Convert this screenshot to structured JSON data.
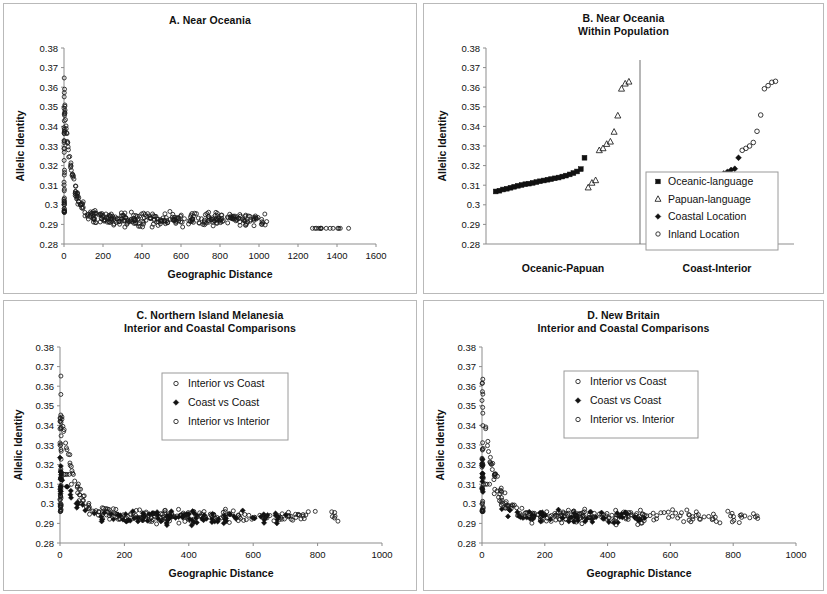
{
  "figure": {
    "panel_count": 4,
    "shared_y_label": "Allelic Identity",
    "shared_x_label": "Geographic Distance"
  },
  "chart_data": [
    {
      "id": "A",
      "type": "scatter",
      "title": "A. Near Oceania",
      "subtitle": "",
      "xlabel": "Geographic Distance",
      "ylabel": "Allelic Identity",
      "xlim": [
        0,
        1600
      ],
      "ylim": [
        0.28,
        0.38
      ],
      "xticks": [
        0,
        200,
        400,
        600,
        800,
        1000,
        1200,
        1400,
        1600
      ],
      "yticks": [
        0.28,
        0.29,
        0.3,
        0.31,
        0.32,
        0.33,
        0.34,
        0.35,
        0.36,
        0.37,
        0.38
      ],
      "ytick_labels": [
        "0.28",
        "0.29",
        "0.3",
        "0.31",
        "0.32",
        "0.33",
        "0.34",
        "0.35",
        "0.36",
        "0.37",
        "0.38"
      ],
      "grid": false,
      "legend": null,
      "series": [
        {
          "name": "Pairwise comparisons",
          "marker": "open-circle",
          "n_points": 430,
          "generator": {
            "kind": "decay-cloud",
            "seed": 17,
            "x_clusters": [
              {
                "x_min": 0,
                "x_max": 3,
                "n": 46,
                "y_min": 0.296,
                "y_max": 0.365
              },
              {
                "x_min": 3,
                "x_max": 60,
                "n": 34,
                "y_min": 0.294,
                "y_max": 0.356
              },
              {
                "x_min": 60,
                "x_max": 200,
                "n": 58,
                "y_min": 0.289,
                "y_max": 0.314
              },
              {
                "x_min": 200,
                "x_max": 520,
                "n": 118,
                "y_min": 0.287,
                "y_max": 0.301
              },
              {
                "x_min": 520,
                "x_max": 1040,
                "n": 152,
                "y_min": 0.288,
                "y_max": 0.3
              },
              {
                "x_min": 1270,
                "x_max": 1460,
                "n": 14,
                "y_min": 0.281,
                "y_max": 0.288
              }
            ],
            "asymptote": 0.2925,
            "decay_amplitude": 0.062,
            "decay_scale": 42
          }
        }
      ]
    },
    {
      "id": "B",
      "type": "scatter",
      "title": "B. Near Oceania",
      "subtitle": "Within Population",
      "xlabel": "",
      "ylabel": "Allelic Identity",
      "ylim": [
        0.28,
        0.38
      ],
      "yticks": [
        0.28,
        0.29,
        0.3,
        0.31,
        0.32,
        0.33,
        0.34,
        0.35,
        0.36,
        0.37,
        0.38
      ],
      "ytick_labels": [
        "0.28",
        "0.29",
        "0.3",
        "0.31",
        "0.32",
        "0.33",
        "0.34",
        "0.35",
        "0.36",
        "0.37",
        "0.38"
      ],
      "grid": false,
      "group_labels": [
        "Oceanic-Papuan",
        "Coast-Interior"
      ],
      "separator": true,
      "legend": {
        "position": "right-lower",
        "entries": [
          {
            "label": "Oceanic-language",
            "marker": "filled-square"
          },
          {
            "label": "Papuan-language",
            "marker": "open-triangle"
          },
          {
            "label": "Coastal Location",
            "marker": "filled-diamond"
          },
          {
            "label": "Inland Location",
            "marker": "open-circle"
          }
        ]
      },
      "series": [
        {
          "name": "Oceanic-language",
          "marker": "filled-square",
          "group": "Oceanic-Papuan",
          "x": [
            1,
            2,
            3,
            4,
            5,
            6,
            7,
            8,
            9,
            10,
            11,
            12,
            13,
            14,
            15,
            16,
            17,
            18,
            19,
            20,
            21,
            22,
            23,
            24,
            25
          ],
          "values": [
            0.3068,
            0.3072,
            0.3078,
            0.3082,
            0.3087,
            0.3092,
            0.3097,
            0.3101,
            0.3105,
            0.3108,
            0.3112,
            0.3116,
            0.312,
            0.3124,
            0.3128,
            0.3131,
            0.3135,
            0.3139,
            0.3144,
            0.3149,
            0.3155,
            0.3162,
            0.317,
            0.3182,
            0.324
          ]
        },
        {
          "name": "Papuan-language",
          "marker": "open-triangle",
          "group": "Oceanic-Papuan",
          "x": [
            26,
            27,
            28,
            29,
            30,
            31,
            32,
            33,
            34,
            35
          ],
          "values": [
            0.3088,
            0.3112,
            0.3125,
            0.3278,
            0.3288,
            0.331,
            0.3322,
            0.3372,
            0.3455,
            0.3592
          ]
        },
        {
          "name": "Papuan-language-high",
          "marker": "open-triangle",
          "group": "Oceanic-Papuan",
          "x": [
            36,
            37
          ],
          "values": [
            0.3618,
            0.3628
          ]
        },
        {
          "name": "Coastal Location",
          "marker": "filled-diamond",
          "group": "Coast-Interior",
          "x": [
            1,
            2,
            3,
            4,
            5,
            6,
            7,
            8,
            9,
            10,
            11,
            12,
            13,
            14,
            15,
            16,
            17,
            18,
            19,
            20,
            21,
            22,
            23,
            24,
            25
          ],
          "values": [
            0.3066,
            0.3071,
            0.3076,
            0.3081,
            0.3086,
            0.309,
            0.3095,
            0.3099,
            0.3103,
            0.3107,
            0.3111,
            0.3115,
            0.3119,
            0.3123,
            0.3127,
            0.3131,
            0.3135,
            0.314,
            0.3146,
            0.3152,
            0.316,
            0.3168,
            0.3178,
            0.3184,
            0.324
          ]
        },
        {
          "name": "Inland Location",
          "marker": "open-circle",
          "group": "Coast-Interior",
          "x": [
            26,
            27,
            28,
            29,
            30,
            31,
            32,
            33,
            34,
            35
          ],
          "values": [
            0.3278,
            0.3288,
            0.33,
            0.3318,
            0.3375,
            0.3458,
            0.3592,
            0.3608,
            0.3625,
            0.363
          ]
        }
      ]
    },
    {
      "id": "C",
      "type": "scatter",
      "title": "C. Northern Island Melanesia",
      "subtitle": "Interior and Coastal Comparisons",
      "xlabel": "Geographic Distance",
      "ylabel": "Allelic Identity",
      "xlim": [
        0,
        1000
      ],
      "ylim": [
        0.28,
        0.38
      ],
      "xticks": [
        0,
        200,
        400,
        600,
        800,
        1000
      ],
      "yticks": [
        0.28,
        0.29,
        0.3,
        0.31,
        0.32,
        0.33,
        0.34,
        0.35,
        0.36,
        0.37,
        0.38
      ],
      "ytick_labels": [
        "0.28",
        "0.29",
        "0.3",
        "0.31",
        "0.32",
        "0.33",
        "0.34",
        "0.35",
        "0.36",
        "0.37",
        "0.38"
      ],
      "grid": false,
      "legend": {
        "position": "upper-right",
        "entries": [
          {
            "label": "Interior vs Coast",
            "marker": "open-circle"
          },
          {
            "label": "Coast vs Coast",
            "marker": "filled-diamond"
          },
          {
            "label": "Interior vs Interior",
            "marker": "open-circle"
          }
        ]
      },
      "series": [
        {
          "name": "Interior vs Coast",
          "marker": "open-circle",
          "n_points": 190,
          "generator": {
            "kind": "decay-cloud",
            "seed": 41,
            "x_clusters": [
              {
                "x_min": 0,
                "x_max": 4,
                "n": 30,
                "y_min": 0.296,
                "y_max": 0.366
              },
              {
                "x_min": 4,
                "x_max": 60,
                "n": 22,
                "y_min": 0.294,
                "y_max": 0.354
              },
              {
                "x_min": 60,
                "x_max": 200,
                "n": 30,
                "y_min": 0.29,
                "y_max": 0.315
              },
              {
                "x_min": 200,
                "x_max": 540,
                "n": 72,
                "y_min": 0.288,
                "y_max": 0.302
              },
              {
                "x_min": 540,
                "x_max": 880,
                "n": 28,
                "y_min": 0.289,
                "y_max": 0.3
              }
            ],
            "asymptote": 0.2935,
            "decay_amplitude": 0.06,
            "decay_scale": 40
          }
        },
        {
          "name": "Coast vs Coast",
          "marker": "filled-diamond",
          "n_points": 120,
          "generator": {
            "kind": "decay-cloud",
            "seed": 73,
            "x_clusters": [
              {
                "x_min": 0,
                "x_max": 4,
                "n": 14,
                "y_min": 0.305,
                "y_max": 0.325
              },
              {
                "x_min": 4,
                "x_max": 80,
                "n": 12,
                "y_min": 0.295,
                "y_max": 0.312
              },
              {
                "x_min": 80,
                "x_max": 260,
                "n": 24,
                "y_min": 0.291,
                "y_max": 0.3
              },
              {
                "x_min": 260,
                "x_max": 540,
                "n": 52,
                "y_min": 0.289,
                "y_max": 0.299
              },
              {
                "x_min": 540,
                "x_max": 720,
                "n": 18,
                "y_min": 0.289,
                "y_max": 0.297
              }
            ],
            "asymptote": 0.293,
            "decay_amplitude": 0.03,
            "decay_scale": 35
          }
        },
        {
          "name": "Interior vs Interior",
          "marker": "open-circle",
          "n_points": 90,
          "generator": {
            "kind": "decay-cloud",
            "seed": 109,
            "x_clusters": [
              {
                "x_min": 0,
                "x_max": 4,
                "n": 16,
                "y_min": 0.297,
                "y_max": 0.345
              },
              {
                "x_min": 4,
                "x_max": 110,
                "n": 16,
                "y_min": 0.294,
                "y_max": 0.315
              },
              {
                "x_min": 110,
                "x_max": 340,
                "n": 24,
                "y_min": 0.289,
                "y_max": 0.301
              },
              {
                "x_min": 340,
                "x_max": 700,
                "n": 26,
                "y_min": 0.288,
                "y_max": 0.3
              },
              {
                "x_min": 700,
                "x_max": 780,
                "n": 8,
                "y_min": 0.289,
                "y_max": 0.299
              }
            ],
            "asymptote": 0.2935,
            "decay_amplitude": 0.045,
            "decay_scale": 38
          }
        }
      ]
    },
    {
      "id": "D",
      "type": "scatter",
      "title": "D. New Britain",
      "subtitle": "Interior and Coastal Comparisons",
      "xlabel": "Geographic Distance",
      "ylabel": "Allelic Identity",
      "xlim": [
        0,
        1000
      ],
      "ylim": [
        0.28,
        0.38
      ],
      "xticks": [
        0,
        200,
        400,
        600,
        800,
        1000
      ],
      "yticks": [
        0.28,
        0.29,
        0.3,
        0.31,
        0.32,
        0.33,
        0.34,
        0.35,
        0.36,
        0.37,
        0.38
      ],
      "ytick_labels": [
        "0.28",
        "0.29",
        "0.3",
        "0.31",
        "0.32",
        "0.33",
        "0.34",
        "0.35",
        "0.36",
        "0.37",
        "0.38"
      ],
      "grid": false,
      "legend": {
        "position": "upper-right",
        "entries": [
          {
            "label": "Interior vs Coast",
            "marker": "open-circle"
          },
          {
            "label": "Coast vs Coast",
            "marker": "filled-diamond"
          },
          {
            "label": "Interior vs. Interior",
            "marker": "open-circle"
          }
        ]
      },
      "series": [
        {
          "name": "Interior vs Coast",
          "marker": "open-circle",
          "n_points": 200,
          "generator": {
            "kind": "decay-cloud",
            "seed": 23,
            "x_clusters": [
              {
                "x_min": 0,
                "x_max": 4,
                "n": 26,
                "y_min": 0.296,
                "y_max": 0.364
              },
              {
                "x_min": 4,
                "x_max": 70,
                "n": 26,
                "y_min": 0.294,
                "y_max": 0.354
              },
              {
                "x_min": 70,
                "x_max": 220,
                "n": 36,
                "y_min": 0.29,
                "y_max": 0.307
              },
              {
                "x_min": 220,
                "x_max": 520,
                "n": 74,
                "y_min": 0.287,
                "y_max": 0.301
              },
              {
                "x_min": 560,
                "x_max": 880,
                "n": 38,
                "y_min": 0.289,
                "y_max": 0.3
              }
            ],
            "asymptote": 0.2935,
            "decay_amplitude": 0.058,
            "decay_scale": 40
          }
        },
        {
          "name": "Coast vs Coast",
          "marker": "filled-diamond",
          "n_points": 70,
          "generator": {
            "kind": "decay-cloud",
            "seed": 57,
            "x_clusters": [
              {
                "x_min": 0,
                "x_max": 3,
                "n": 12,
                "y_min": 0.306,
                "y_max": 0.325
              },
              {
                "x_min": 60,
                "x_max": 180,
                "n": 14,
                "y_min": 0.292,
                "y_max": 0.299
              },
              {
                "x_min": 180,
                "x_max": 340,
                "n": 20,
                "y_min": 0.291,
                "y_max": 0.297
              },
              {
                "x_min": 340,
                "x_max": 470,
                "n": 16,
                "y_min": 0.29,
                "y_max": 0.296
              },
              {
                "x_min": 470,
                "x_max": 530,
                "n": 6,
                "y_min": 0.29,
                "y_max": 0.295
              }
            ],
            "asymptote": 0.293,
            "decay_amplitude": 0.03,
            "decay_scale": 30
          }
        },
        {
          "name": "Interior vs. Interior",
          "marker": "open-circle",
          "n_points": 80,
          "generator": {
            "kind": "decay-cloud",
            "seed": 131,
            "x_clusters": [
              {
                "x_min": 0,
                "x_max": 4,
                "n": 14,
                "y_min": 0.296,
                "y_max": 0.34
              },
              {
                "x_min": 4,
                "x_max": 120,
                "n": 16,
                "y_min": 0.293,
                "y_max": 0.31
              },
              {
                "x_min": 120,
                "x_max": 350,
                "n": 22,
                "y_min": 0.288,
                "y_max": 0.3
              },
              {
                "x_min": 350,
                "x_max": 620,
                "n": 20,
                "y_min": 0.288,
                "y_max": 0.299
              },
              {
                "x_min": 620,
                "x_max": 770,
                "n": 8,
                "y_min": 0.289,
                "y_max": 0.299
              }
            ],
            "asymptote": 0.2935,
            "decay_amplitude": 0.042,
            "decay_scale": 36
          }
        }
      ]
    }
  ]
}
